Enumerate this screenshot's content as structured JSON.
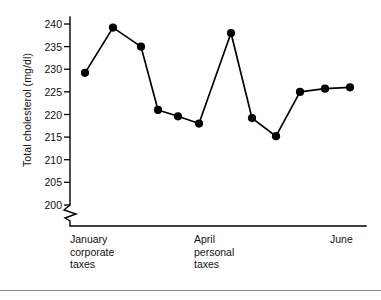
{
  "chart_data": {
    "type": "line",
    "title": "",
    "subtitle": "",
    "xlabel": "",
    "ylabel": "Total cholesterol (mg/dl)",
    "ylim": [
      198,
      241
    ],
    "yticks": [
      200,
      205,
      210,
      215,
      220,
      225,
      230,
      235,
      240
    ],
    "ytick_labels": [
      "200",
      "205",
      "210",
      "215",
      "220",
      "225",
      "230",
      "235",
      "240"
    ],
    "y_axis_break": true,
    "y_axis_break_note": "zigzag break between axis origin and 200",
    "grid": false,
    "legend": null,
    "x": [
      1,
      2,
      3,
      4,
      5,
      6,
      7,
      8,
      9,
      10,
      11,
      12
    ],
    "values": [
      229.2,
      239.2,
      235.0,
      221.0,
      219.6,
      218.0,
      238.0,
      219.2,
      215.2,
      225.0,
      225.7,
      226.0
    ],
    "series": [
      {
        "name": "Total cholesterol",
        "values": [
          229.2,
          239.2,
          235.0,
          221.0,
          219.6,
          218.0,
          238.0,
          219.2,
          215.2,
          225.0,
          225.7,
          226.0
        ]
      }
    ],
    "marker": "filled-circle",
    "line_color": "#000000",
    "marker_color": "#000000",
    "x_category_labels": [
      {
        "text": "January\ncorporate\ntaxes",
        "at_point_index": 1
      },
      {
        "text": "April\npersonal\ntaxes",
        "at_point_index": 7
      },
      {
        "text": "June",
        "at_point_index": 12
      }
    ],
    "annotations": []
  },
  "axis": {
    "y_title": "Total cholesterol (mg/dl)",
    "ticks": [
      "240",
      "235",
      "230",
      "225",
      "220",
      "215",
      "210",
      "205",
      "200"
    ]
  },
  "xlabels": {
    "january": "January\ncorporate\ntaxes",
    "april": "April\npersonal\ntaxes",
    "june": "June"
  }
}
